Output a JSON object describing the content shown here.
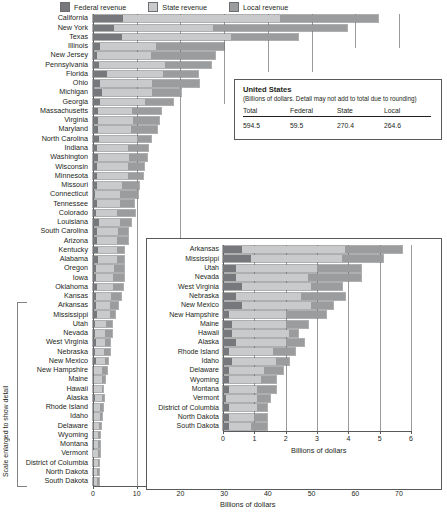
{
  "legend": {
    "entries": [
      {
        "label": "Federal revenue",
        "color": "#76787b",
        "icon": "legend-swatch-icon"
      },
      {
        "label": "State revenue",
        "color": "#c9cacb",
        "icon": "legend-swatch-icon"
      },
      {
        "label": "Local revenue",
        "color": "#9a9c9e",
        "icon": "legend-swatch-icon"
      }
    ]
  },
  "side_note": "Scale enlarged to show detail",
  "us_box": {
    "title": "United States",
    "subtitle": "(Billions of dollars. Detail may not add to total due to rounding)",
    "headers": [
      "Total",
      "Federal",
      "State",
      "Local"
    ],
    "values": [
      "594.5",
      "59.5",
      "270.4",
      "264.6"
    ]
  },
  "chart_data": [
    {
      "type": "bar",
      "orientation": "horizontal",
      "stacked": true,
      "title": "",
      "xlabel": "Billions of dollars",
      "ylabel": "",
      "xlim": [
        0,
        70
      ],
      "xticks": [
        0,
        10,
        20,
        30,
        40,
        50,
        60,
        70
      ],
      "grid": true,
      "legend_position": "top",
      "series": [
        {
          "name": "Federal revenue",
          "color": "#76787b"
        },
        {
          "name": "State revenue",
          "color": "#c9cacb"
        },
        {
          "name": "Local revenue",
          "color": "#9a9c9e"
        }
      ],
      "categories": [
        "California",
        "New York",
        "Texas",
        "Illinois",
        "New Jersey",
        "Pennsylvania",
        "Florida",
        "Ohio",
        "Michigan",
        "Georgia",
        "Massachusetts",
        "Virginia",
        "Maryland",
        "North Carolina",
        "Indiana",
        "Washington",
        "Wisconsin",
        "Minnesota",
        "Missouri",
        "Connecticut",
        "Tennessee",
        "Colorado",
        "Louisiana",
        "South Carolina",
        "Arizona",
        "Kentucky",
        "Alabama",
        "Oregon",
        "Iowa",
        "Oklahoma",
        "Kansas",
        "Arkansas",
        "Mississippi",
        "Utah",
        "Nevada",
        "West Virginia",
        "Nebraska",
        "New Mexico",
        "New Hampshire",
        "Maine",
        "Hawaii",
        "Alaska",
        "Rhode Island",
        "Idaho",
        "Delaware",
        "Wyoming",
        "Montana",
        "Vermont",
        "District of Columbia",
        "North Dakota",
        "South Dakota"
      ],
      "values": {
        "federal": [
          6.8,
          4.7,
          6.6,
          1.6,
          1.0,
          1.4,
          3.1,
          1.7,
          2.1,
          1.5,
          1.1,
          1.2,
          1.1,
          1.4,
          0.9,
          1.1,
          0.9,
          0.9,
          1.0,
          0.5,
          1.0,
          0.7,
          1.4,
          0.9,
          1.0,
          1.2,
          1.2,
          0.8,
          0.6,
          0.9,
          0.6,
          0.6,
          0.9,
          0.4,
          0.4,
          0.6,
          0.4,
          0.6,
          0.2,
          0.3,
          0.3,
          0.4,
          0.2,
          0.3,
          0.2,
          0.2,
          0.2,
          0.1,
          0.2,
          0.2,
          0.2
        ],
        "state": [
          36.0,
          22.8,
          25.0,
          12.8,
          12.3,
          15.1,
          13.0,
          11.9,
          11.3,
          10.4,
          7.9,
          8.0,
          7.5,
          8.7,
          7.0,
          7.1,
          7.2,
          7.0,
          5.6,
          5.7,
          5.2,
          4.9,
          4.8,
          4.8,
          4.4,
          4.3,
          4.4,
          4.1,
          4.0,
          3.7,
          3.6,
          3.3,
          2.9,
          2.6,
          2.3,
          2.2,
          2.1,
          2.2,
          1.8,
          1.7,
          1.8,
          1.6,
          1.4,
          1.4,
          1.1,
          1.0,
          0.9,
          1.0,
          0.9,
          0.8,
          0.7
        ],
        "local": [
          22.5,
          30.6,
          15.4,
          15.6,
          14.7,
          10.6,
          7.9,
          10.6,
          6.8,
          6.5,
          6.6,
          5.8,
          6.1,
          3.2,
          4.6,
          4.1,
          3.5,
          3.5,
          3.9,
          4.1,
          3.2,
          4.0,
          2.4,
          2.2,
          2.5,
          1.7,
          1.5,
          2.1,
          2.4,
          2.2,
          2.3,
          1.8,
          1.3,
          1.4,
          1.7,
          1.0,
          1.4,
          0.7,
          1.3,
          0.7,
          0.3,
          0.6,
          0.7,
          0.4,
          0.6,
          0.5,
          0.6,
          0.4,
          0.3,
          0.4,
          0.5
        ]
      }
    },
    {
      "type": "bar",
      "orientation": "horizontal",
      "stacked": true,
      "inset": true,
      "title": "",
      "xlabel": "Billions of dollars",
      "ylabel": "",
      "xlim": [
        0,
        6
      ],
      "xticks": [
        0,
        1,
        2,
        3,
        4,
        5,
        6
      ],
      "grid": true,
      "series": [
        {
          "name": "Federal revenue",
          "color": "#76787b"
        },
        {
          "name": "State revenue",
          "color": "#c9cacb"
        },
        {
          "name": "Local revenue",
          "color": "#9a9c9e"
        }
      ],
      "categories": [
        "Arkansas",
        "Mississippi",
        "Utah",
        "Nevada",
        "West Virginia",
        "Nebraska",
        "New Mexico",
        "New Hampshire",
        "Maine",
        "Hawaii",
        "Alaska",
        "Rhode Island",
        "Idaho",
        "Delaware",
        "Wyoming",
        "Montana",
        "Vermont",
        "District of Columbia",
        "North Dakota",
        "South Dakota"
      ],
      "values": {
        "federal": [
          0.6,
          0.9,
          0.4,
          0.4,
          0.6,
          0.4,
          0.6,
          0.2,
          0.3,
          0.3,
          0.4,
          0.2,
          0.3,
          0.2,
          0.2,
          0.2,
          0.1,
          0.2,
          0.2,
          0.2
        ],
        "state": [
          3.3,
          2.9,
          2.6,
          2.3,
          2.2,
          2.1,
          2.2,
          1.8,
          1.7,
          1.8,
          1.6,
          1.4,
          1.4,
          1.1,
          1.0,
          0.9,
          1.0,
          0.9,
          0.8,
          0.7
        ],
        "local": [
          1.8,
          1.3,
          1.4,
          1.7,
          1.0,
          1.4,
          0.7,
          1.3,
          0.7,
          0.3,
          0.6,
          0.7,
          0.4,
          0.6,
          0.5,
          0.6,
          0.4,
          0.3,
          0.4,
          0.5
        ]
      }
    }
  ]
}
